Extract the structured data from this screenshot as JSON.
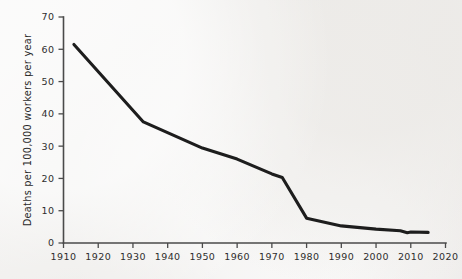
{
  "chart_data": {
    "type": "line",
    "title": "",
    "subtitle": "",
    "xlabel": "",
    "ylabel": "Deaths per 100,000 workers per year",
    "xlim": [
      1910,
      2020
    ],
    "ylim": [
      0,
      70
    ],
    "grid": false,
    "legend": null,
    "x_ticks": [
      1910,
      1920,
      1930,
      1940,
      1950,
      1960,
      1970,
      1980,
      1990,
      2000,
      2010,
      2020
    ],
    "x_tick_labels": [
      "1910",
      "1920",
      "1930",
      "1940",
      "1950",
      "1960",
      "1970",
      "1980",
      "1990",
      "2000",
      "2010",
      "2020"
    ],
    "y_ticks": [
      0,
      10,
      20,
      30,
      40,
      50,
      60,
      70
    ],
    "y_tick_labels": [
      "0",
      "10",
      "20",
      "30",
      "40",
      "50",
      "60",
      "70"
    ],
    "series": [
      {
        "name": "Workplace death rate",
        "color": "#1d1d1d",
        "x": [
          1913,
          1933,
          1950,
          1960,
          1970,
          1973,
          1980,
          1990,
          2000,
          2007,
          2009,
          2010,
          2015
        ],
        "values": [
          61.5,
          37.5,
          29.4,
          26.0,
          21.4,
          20.3,
          7.7,
          5.3,
          4.3,
          3.8,
          3.2,
          3.4,
          3.3
        ]
      }
    ],
    "annotations": []
  },
  "figure": {
    "background_color": "#f2f1ef",
    "axis_color": "#4a4a4a",
    "line_color": "#1d1d1d"
  }
}
